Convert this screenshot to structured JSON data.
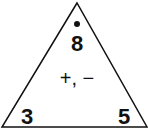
{
  "diagram": {
    "type": "fact-family-triangle",
    "top_number": "8",
    "left_number": "3",
    "right_number": "5",
    "operations": "+, −",
    "marker": "dot",
    "colors": {
      "stroke": "#111111",
      "background": "#ffffff"
    }
  }
}
